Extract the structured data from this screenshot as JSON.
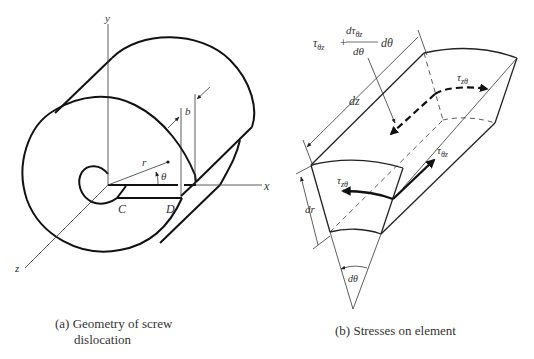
{
  "figure_a": {
    "labels": {
      "y_axis": "y",
      "x_axis": "x",
      "z_axis": "z",
      "radius": "r",
      "angle": "θ",
      "burgers": "b",
      "point_c": "C",
      "point_d": "D"
    },
    "caption_line1": "(a)  Geometry of screw",
    "caption_line2": "dislocation"
  },
  "figure_b": {
    "labels": {
      "tau_main": "τ",
      "tau_theta_z_sub": "θz",
      "plus": "+",
      "deriv_num": "dτ",
      "deriv_num_sub": "θz",
      "deriv_den": "dθ",
      "deriv_tail": "dθ",
      "dz": "dz",
      "dr": "dr",
      "dtheta": "dθ",
      "tau_z_theta_top": "τ",
      "tau_z_theta_top_sub": "zθ",
      "tau_theta_z_right": "τ",
      "tau_theta_z_right_sub": "θz",
      "tau_z_theta_front": "τ",
      "tau_z_theta_front_sub": "zθ"
    },
    "caption": "(b)  Stresses on element"
  }
}
